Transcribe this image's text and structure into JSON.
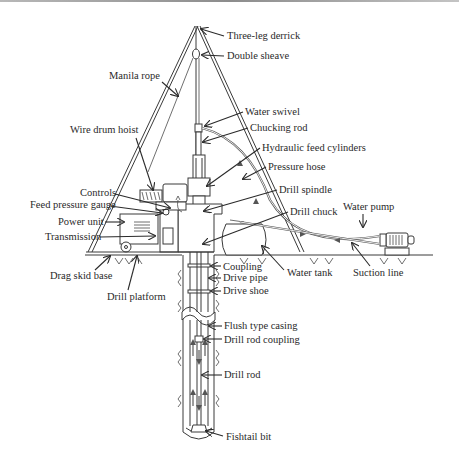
{
  "diagram": {
    "type": "wash-boring drilling rig schematic",
    "labels": {
      "three_leg_derrick": "Three-leg derrick",
      "double_sheave": "Double sheave",
      "manila_rope": "Manila rope",
      "water_swivel": "Water swivel",
      "chucking_rod": "Chucking rod",
      "hydraulic_feed_cylinders": "Hydraulic feed cylinders",
      "wire_drum_hoist": "Wire drum hoist",
      "pressure_hose": "Pressure hose",
      "controls": "Controls",
      "feed_pressure_gauge": "Feed pressure gauge",
      "drill_spindle": "Drill spindle",
      "drill_chuck": "Drill chuck",
      "power_unit": "Power unit",
      "water_pump": "Water pump",
      "transmission": "Transmission",
      "drag_skid_base": "Drag skid base",
      "drill_platform": "Drill platform",
      "coupling": "Coupling",
      "drive_pipe": "Drive pipe",
      "drive_shoe": "Drive shoe",
      "water_tank": "Water tank",
      "suction_line": "Suction line",
      "flush_type_casing": "Flush type casing",
      "drill_rod_coupling": "Drill rod coupling",
      "drill_rod": "Drill rod",
      "fishtail_bit": "Fishtail bit"
    },
    "colors": {
      "line": "#3a3a3a",
      "text": "#2a2a2a",
      "background": "#ffffff"
    }
  }
}
